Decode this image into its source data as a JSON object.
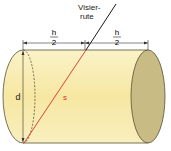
{
  "diagram": {
    "type": "cylinder-measurement",
    "labels": {
      "rod_line1": "Visier-",
      "rod_line2": "rute",
      "half_h_numerator": "h",
      "half_h_denominator": "2",
      "diameter": "d",
      "slant": "s"
    },
    "colors": {
      "cylinder_body": "#f8eaa8",
      "cylinder_end": "#c9bb84",
      "outline": "#555033",
      "slant_line": "#d9302a",
      "slant_label": "#d9302a",
      "rod": "#1a1a1a",
      "dimension": "#333333"
    }
  }
}
